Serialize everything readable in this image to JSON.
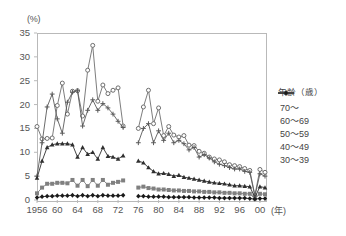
{
  "chart_data": {
    "type": "line",
    "title": "",
    "xlabel": "(年)",
    "ylabel": "(%)",
    "ylim": [
      0,
      35
    ],
    "ytick_labels": [
      "0",
      "5",
      "10",
      "15",
      "20",
      "25",
      "30",
      "35"
    ],
    "xtick_labels": [
      "1956",
      "60",
      "64",
      "68",
      "72",
      "76",
      "80",
      "84",
      "88",
      "92",
      "96",
      "00"
    ],
    "xlim": [
      1956,
      2001
    ],
    "grid": false,
    "legend_position": "right",
    "legend_title": "年齢（歳）",
    "gap_years": [
      1974,
      1975
    ],
    "series": [
      {
        "name": "70~",
        "marker": "circle-open",
        "color": "#6e6e6e",
        "x": [
          1956,
          1957,
          1958,
          1959,
          1960,
          1961,
          1962,
          1963,
          1964,
          1965,
          1966,
          1967,
          1968,
          1969,
          1970,
          1971,
          1972,
          1973,
          1976,
          1977,
          1978,
          1979,
          1980,
          1981,
          1982,
          1983,
          1984,
          1985,
          1986,
          1987,
          1988,
          1989,
          1990,
          1991,
          1992,
          1993,
          1994,
          1995,
          1996,
          1997,
          1998,
          1999,
          2000,
          2001
        ],
        "values": [
          15.4,
          12.8,
          12.9,
          13.0,
          19.8,
          24.5,
          18.0,
          22.8,
          22.9,
          17.6,
          27.2,
          32.4,
          20.7,
          24.1,
          22.3,
          23.0,
          23.5,
          15.5,
          15.0,
          19.5,
          23.0,
          16.0,
          19.3,
          13.5,
          15.4,
          13.6,
          13.2,
          13.5,
          11.5,
          11.4,
          10.2,
          9.8,
          9.0,
          8.6,
          8.4,
          8.0,
          7.4,
          7.2,
          7.0,
          6.6,
          6.2,
          1.0,
          6.4,
          5.8
        ]
      },
      {
        "name": "60~69",
        "marker": "asterisk",
        "color": "#5a5a5a",
        "x": [
          1956,
          1957,
          1958,
          1959,
          1960,
          1961,
          1962,
          1963,
          1964,
          1965,
          1966,
          1967,
          1968,
          1969,
          1970,
          1971,
          1972,
          1973,
          1976,
          1977,
          1978,
          1979,
          1980,
          1981,
          1982,
          1983,
          1984,
          1985,
          1986,
          1987,
          1988,
          1989,
          1990,
          1991,
          1992,
          1993,
          1994,
          1995,
          1996,
          1997,
          1998,
          1999,
          2000,
          2001
        ],
        "values": [
          5.0,
          12.0,
          19.5,
          22.2,
          17.0,
          14.0,
          20.5,
          22.6,
          22.9,
          15.5,
          18.8,
          21.0,
          18.8,
          20.2,
          19.3,
          18.0,
          16.5,
          15.2,
          12.0,
          15.0,
          16.0,
          12.0,
          14.5,
          12.5,
          14.0,
          12.0,
          12.5,
          11.8,
          10.5,
          11.0,
          9.0,
          9.5,
          8.8,
          8.0,
          7.5,
          7.2,
          6.8,
          6.5,
          6.5,
          6.0,
          5.8,
          0.8,
          5.5,
          5.0
        ]
      },
      {
        "name": "50~59",
        "marker": "triangle",
        "color": "#2f2f2f",
        "x": [
          1956,
          1957,
          1958,
          1959,
          1960,
          1961,
          1962,
          1963,
          1964,
          1965,
          1966,
          1967,
          1968,
          1969,
          1970,
          1971,
          1972,
          1973,
          1976,
          1977,
          1978,
          1979,
          1980,
          1981,
          1982,
          1983,
          1984,
          1985,
          1986,
          1987,
          1988,
          1989,
          1990,
          1991,
          1992,
          1993,
          1994,
          1995,
          1996,
          1997,
          1998,
          1999,
          2000,
          2001
        ],
        "values": [
          4.6,
          8.2,
          11.0,
          11.6,
          11.8,
          11.8,
          11.8,
          11.6,
          9.0,
          11.0,
          9.6,
          10.0,
          8.6,
          11.0,
          9.2,
          9.0,
          8.6,
          9.3,
          8.2,
          7.8,
          6.8,
          6.0,
          5.5,
          5.6,
          5.4,
          5.0,
          5.2,
          4.8,
          4.6,
          4.4,
          4.2,
          4.0,
          3.8,
          3.6,
          3.5,
          3.4,
          3.2,
          3.0,
          3.0,
          2.9,
          2.8,
          0.5,
          2.8,
          2.6
        ]
      },
      {
        "name": "40~49",
        "marker": "square",
        "color": "#808080",
        "x": [
          1956,
          1957,
          1958,
          1959,
          1960,
          1961,
          1962,
          1963,
          1964,
          1965,
          1966,
          1967,
          1968,
          1969,
          1970,
          1971,
          1972,
          1973,
          1976,
          1977,
          1978,
          1979,
          1980,
          1981,
          1982,
          1983,
          1984,
          1985,
          1986,
          1987,
          1988,
          1989,
          1990,
          1991,
          1992,
          1993,
          1994,
          1995,
          1996,
          1997,
          1998,
          1999,
          2000,
          2001
        ],
        "values": [
          1.4,
          2.6,
          3.4,
          3.4,
          3.6,
          3.6,
          3.5,
          4.2,
          3.0,
          4.2,
          2.9,
          4.2,
          3.0,
          4.2,
          3.2,
          3.6,
          3.8,
          4.1,
          2.6,
          2.8,
          2.5,
          2.4,
          2.2,
          2.2,
          2.1,
          2.0,
          2.0,
          1.9,
          1.9,
          1.8,
          1.8,
          1.7,
          1.7,
          1.6,
          1.6,
          1.5,
          1.5,
          1.4,
          1.4,
          1.3,
          1.3,
          0.3,
          1.3,
          1.2
        ]
      },
      {
        "name": "30~39",
        "marker": "diamond",
        "color": "#1a1a1a",
        "x": [
          1956,
          1957,
          1958,
          1959,
          1960,
          1961,
          1962,
          1963,
          1964,
          1965,
          1966,
          1967,
          1968,
          1969,
          1970,
          1971,
          1972,
          1973,
          1976,
          1977,
          1978,
          1979,
          1980,
          1981,
          1982,
          1983,
          1984,
          1985,
          1986,
          1987,
          1988,
          1989,
          1990,
          1991,
          1992,
          1993,
          1994,
          1995,
          1996,
          1997,
          1998,
          1999,
          2000,
          2001
        ],
        "values": [
          0.5,
          0.7,
          0.8,
          0.8,
          0.9,
          0.9,
          0.9,
          1.0,
          0.8,
          1.0,
          0.8,
          1.0,
          0.8,
          1.0,
          0.9,
          0.9,
          0.9,
          1.0,
          0.8,
          0.8,
          0.7,
          0.7,
          0.7,
          0.7,
          0.6,
          0.6,
          0.6,
          0.6,
          0.6,
          0.5,
          0.5,
          0.5,
          0.5,
          0.5,
          0.4,
          0.4,
          0.4,
          0.4,
          0.4,
          0.4,
          0.3,
          0.2,
          0.3,
          0.3
        ]
      }
    ]
  },
  "legend": {
    "title": "年齢（歳）",
    "items": [
      {
        "label": "70～"
      },
      {
        "label": "60～69"
      },
      {
        "label": "50～59"
      },
      {
        "label": "40～49"
      },
      {
        "label": "30～39"
      }
    ]
  },
  "axes": {
    "y_unit": "(%)",
    "x_unit": "(年)"
  },
  "caption": {
    "text": ""
  }
}
